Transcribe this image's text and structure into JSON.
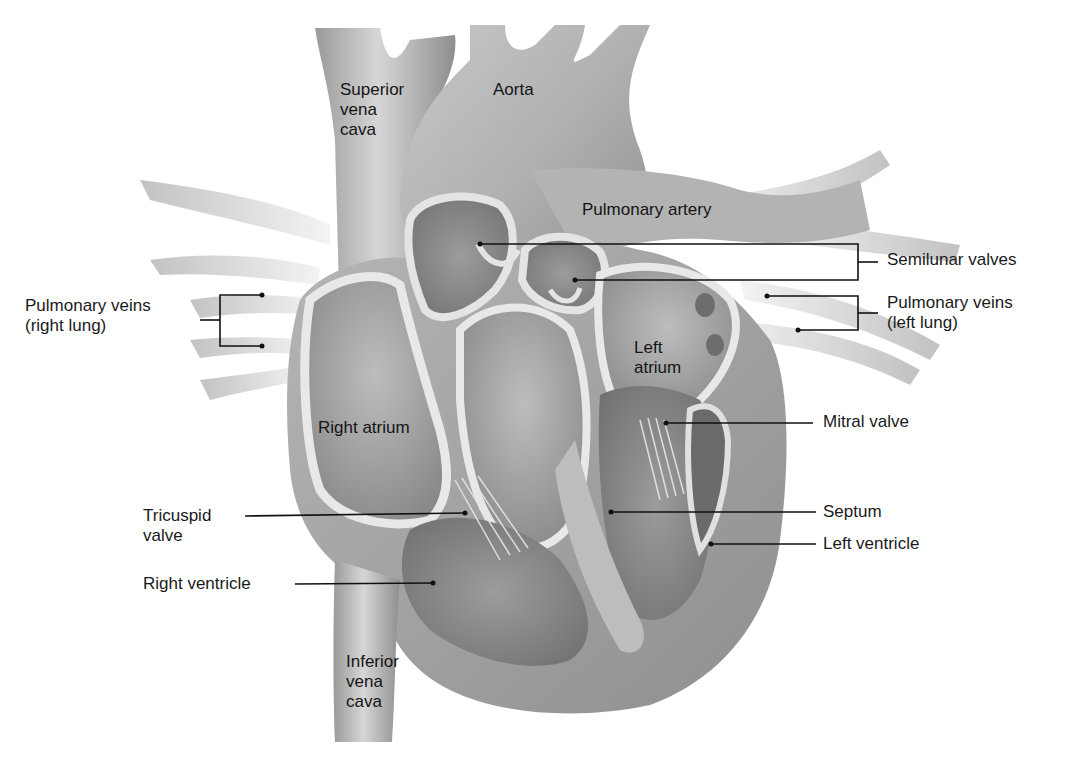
{
  "diagram": {
    "colors": {
      "background": "#ffffff",
      "tissue_light": "#d9d9d9",
      "tissue_mid": "#a8a8a8",
      "tissue_dark": "#7a7a7a",
      "chamber_dark": "#8c8c8c",
      "wall_highlight": "#e6e6e6",
      "leader_line": "#111111",
      "label_text": "#1a1a1a"
    },
    "labels": {
      "superior_vena_cava": "Superior\nvena\ncava",
      "aorta": "Aorta",
      "pulmonary_artery": "Pulmonary artery",
      "semilunar_valves": "Semilunar valves",
      "pulmonary_veins_right": "Pulmonary veins\n(right lung)",
      "pulmonary_veins_left": "Pulmonary veins\n(left lung)",
      "left_atrium": "Left\natrium",
      "right_atrium": "Right atrium",
      "mitral_valve": "Mitral valve",
      "tricuspid_valve": "Tricuspid\nvalve",
      "septum": "Septum",
      "left_ventricle": "Left ventricle",
      "right_ventricle": "Right ventricle",
      "inferior_vena_cava": "Inferior\nvena\ncava"
    }
  }
}
